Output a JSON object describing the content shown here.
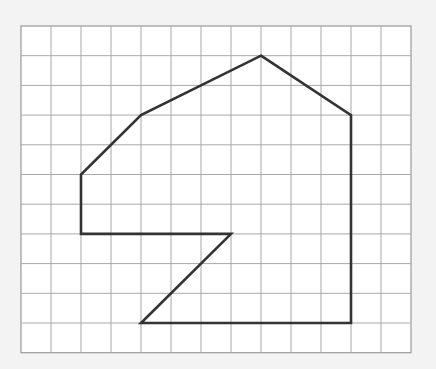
{
  "figure": {
    "grid": {
      "columns": 13,
      "rows": 11,
      "origin_px": [
        21,
        26
      ],
      "cell_w": 30,
      "cell_h": 29.7,
      "line_color": "#a8a8a8",
      "border_color": "#999999",
      "fill_color": "#ffffff"
    },
    "polygon": {
      "stroke_color": "#333333",
      "stroke_width": 2.6,
      "vertices_grid": [
        [
          8,
          1
        ],
        [
          11,
          3
        ],
        [
          11,
          10
        ],
        [
          4,
          10
        ],
        [
          7,
          7
        ],
        [
          2,
          7
        ],
        [
          2,
          5
        ],
        [
          4,
          3
        ]
      ]
    }
  }
}
